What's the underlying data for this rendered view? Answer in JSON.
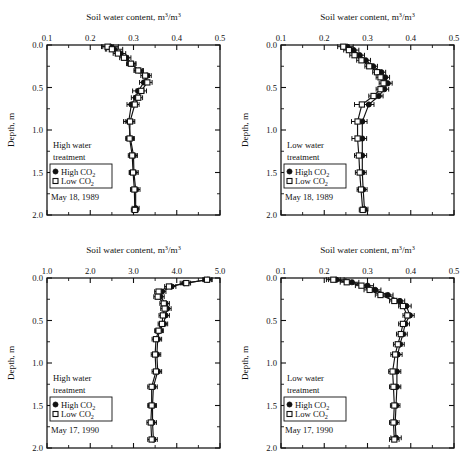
{
  "figure": {
    "background": "#ffffff",
    "ink_color": "#111111",
    "panel_count": 4
  },
  "labels": {
    "xlabel_prefix": "Soil water content, m",
    "xlabel_sup1": "3",
    "xlabel_mid": "/m",
    "xlabel_sup2": "3",
    "ylabel": "Depth, m",
    "legend_high": "High CO",
    "legend_low": "Low CO",
    "legend_sub": "2",
    "treatment_high_line1": "High water",
    "treatment_high_line2": "treatment",
    "treatment_low_line1": "Low water",
    "treatment_low_line2": "treatment",
    "date_1989": "May 18, 1989",
    "date_1990": "May 17, 1990"
  },
  "chart_data": [
    {
      "id": "top-left",
      "type": "line",
      "title": "Soil water content, m3/m3",
      "xlabel": "Soil water content, m3/m3",
      "ylabel": "Depth, m",
      "treatment": "High water treatment",
      "date": "May 18, 1989",
      "xlim": [
        0.1,
        0.5
      ],
      "ylim": [
        0.0,
        2.0
      ],
      "xticks": [
        "0.1",
        "0.2",
        "0.3",
        "0.4",
        "0.5"
      ],
      "xtick_values": [
        0.1,
        0.2,
        0.3,
        0.4,
        0.5
      ],
      "yticks": [
        "0.0",
        "0.5",
        "1.0",
        "1.5",
        "2.0"
      ],
      "ytick_values": [
        0.0,
        0.5,
        1.0,
        1.5,
        2.0
      ],
      "y_inverted": true,
      "grid": false,
      "legend_position": "lower-left",
      "series": [
        {
          "name": "High CO2",
          "marker": "filled-circle",
          "depth": [
            0.02,
            0.05,
            0.1,
            0.15,
            0.22,
            0.3,
            0.36,
            0.44,
            0.54,
            0.62,
            0.7,
            0.9,
            1.1,
            1.3,
            1.5,
            1.7,
            1.92
          ],
          "values": [
            0.247,
            0.255,
            0.27,
            0.284,
            0.296,
            0.313,
            0.331,
            0.324,
            0.311,
            0.305,
            0.295,
            0.289,
            0.293,
            0.3,
            0.301,
            0.305,
            0.305
          ],
          "xerr": [
            0.018,
            0.02,
            0.012,
            0.01,
            0.01,
            0.01,
            0.01,
            0.01,
            0.013,
            0.01,
            0.01,
            0.012,
            0.009,
            0.009,
            0.01,
            0.01,
            0.008
          ]
        },
        {
          "name": "Low CO2",
          "marker": "open-square",
          "depth": [
            0.02,
            0.05,
            0.1,
            0.15,
            0.22,
            0.3,
            0.36,
            0.44,
            0.54,
            0.62,
            0.7,
            0.9,
            1.1,
            1.3,
            1.5,
            1.7,
            1.94
          ],
          "values": [
            0.24,
            0.25,
            0.264,
            0.278,
            0.294,
            0.311,
            0.327,
            0.332,
            0.318,
            0.311,
            0.303,
            0.292,
            0.291,
            0.297,
            0.299,
            0.302,
            0.303
          ],
          "xerr": [
            0.014,
            0.012,
            0.011,
            0.01,
            0.01,
            0.01,
            0.01,
            0.011,
            0.012,
            0.01,
            0.01,
            0.011,
            0.009,
            0.009,
            0.009,
            0.009,
            0.008
          ]
        }
      ]
    },
    {
      "id": "top-right",
      "type": "line",
      "title": "Soil water content, m3/m3",
      "xlabel": "Soil water content, m3/m3",
      "ylabel": "Depth, m",
      "treatment": "Low water treatment",
      "date": "May 18, 1989",
      "xlim": [
        0.1,
        0.5
      ],
      "ylim": [
        0.0,
        2.0
      ],
      "xticks": [
        "0.1",
        "0.2",
        "0.3",
        "0.4",
        "0.5"
      ],
      "xtick_values": [
        0.1,
        0.2,
        0.3,
        0.4,
        0.5
      ],
      "yticks": [
        "0.0",
        "0.5",
        "1.0",
        "1.5",
        "2.0"
      ],
      "ytick_values": [
        0.0,
        0.5,
        1.0,
        1.5,
        2.0
      ],
      "y_inverted": true,
      "grid": false,
      "legend_position": "lower-left",
      "series": [
        {
          "name": "High CO2",
          "marker": "filled-circle",
          "depth": [
            0.02,
            0.06,
            0.12,
            0.18,
            0.25,
            0.32,
            0.38,
            0.45,
            0.52,
            0.6,
            0.7,
            0.9,
            1.1,
            1.3,
            1.5,
            1.7,
            1.93
          ],
          "values": [
            0.253,
            0.268,
            0.282,
            0.296,
            0.313,
            0.332,
            0.341,
            0.347,
            0.339,
            0.326,
            0.303,
            0.288,
            0.288,
            0.288,
            0.288,
            0.29,
            0.293
          ],
          "xerr": [
            0.014,
            0.012,
            0.011,
            0.011,
            0.01,
            0.01,
            0.01,
            0.01,
            0.01,
            0.01,
            0.012,
            0.011,
            0.01,
            0.01,
            0.009,
            0.009,
            0.008
          ]
        },
        {
          "name": "Low CO2",
          "marker": "open-square",
          "depth": [
            0.02,
            0.06,
            0.12,
            0.18,
            0.25,
            0.32,
            0.38,
            0.45,
            0.52,
            0.6,
            0.7,
            0.9,
            1.1,
            1.3,
            1.5,
            1.7,
            1.94
          ],
          "values": [
            0.244,
            0.257,
            0.27,
            0.286,
            0.304,
            0.322,
            0.33,
            0.337,
            0.33,
            0.314,
            0.287,
            0.277,
            0.277,
            0.28,
            0.282,
            0.285,
            0.289
          ],
          "xerr": [
            0.013,
            0.012,
            0.011,
            0.011,
            0.01,
            0.01,
            0.01,
            0.01,
            0.01,
            0.011,
            0.017,
            0.014,
            0.013,
            0.01,
            0.01,
            0.009,
            0.008
          ]
        }
      ]
    },
    {
      "id": "bottom-left",
      "type": "line",
      "title": "Soil water content, m3/m3",
      "xlabel": "Soil water content, m3/m3",
      "ylabel": "Depth, m",
      "treatment": "High water treatment",
      "date": "May 17, 1990",
      "xlim": [
        1.0,
        5.0
      ],
      "ylim": [
        0.0,
        2.0
      ],
      "xticks": [
        "1.0",
        "2.0",
        "3.0",
        "4.0",
        "5.0"
      ],
      "xtick_values": [
        1.0,
        2.0,
        3.0,
        4.0,
        5.0
      ],
      "yticks": [
        "0.0",
        "0.5",
        "1.0",
        "1.5",
        "2.0"
      ],
      "ytick_values": [
        0.0,
        0.5,
        1.0,
        1.5,
        2.0
      ],
      "y_inverted": true,
      "grid": false,
      "legend_position": "lower-left",
      "series": [
        {
          "name": "High CO2",
          "marker": "filled-circle",
          "depth": [
            0.02,
            0.06,
            0.1,
            0.16,
            0.22,
            0.3,
            0.36,
            0.44,
            0.54,
            0.62,
            0.72,
            0.9,
            1.1,
            1.28,
            1.5,
            1.7,
            1.9
          ],
          "values": [
            4.72,
            4.18,
            3.88,
            3.66,
            3.62,
            3.74,
            3.78,
            3.74,
            3.7,
            3.6,
            3.56,
            3.54,
            3.56,
            3.46,
            3.44,
            3.44,
            3.46
          ],
          "xerr": [
            0.1,
            0.1,
            0.1,
            0.09,
            0.09,
            0.09,
            0.09,
            0.09,
            0.09,
            0.09,
            0.09,
            0.09,
            0.09,
            0.09,
            0.09,
            0.09,
            0.09
          ]
        },
        {
          "name": "Low CO2",
          "marker": "open-square",
          "depth": [
            0.02,
            0.06,
            0.1,
            0.16,
            0.22,
            0.3,
            0.36,
            0.44,
            0.54,
            0.62,
            0.72,
            0.9,
            1.1,
            1.28,
            1.5,
            1.7,
            1.9
          ],
          "values": [
            4.7,
            4.22,
            3.82,
            3.58,
            3.56,
            3.7,
            3.72,
            3.68,
            3.66,
            3.58,
            3.52,
            3.5,
            3.52,
            3.42,
            3.42,
            3.4,
            3.42
          ],
          "xerr": [
            0.1,
            0.1,
            0.1,
            0.09,
            0.09,
            0.09,
            0.09,
            0.09,
            0.09,
            0.09,
            0.09,
            0.09,
            0.09,
            0.09,
            0.09,
            0.09,
            0.09
          ]
        }
      ]
    },
    {
      "id": "bottom-right",
      "type": "line",
      "title": "Soil water content, m3/m3",
      "xlabel": "Soil water content, m3/m3",
      "ylabel": "Depth, m",
      "treatment": "Low water treatment",
      "date": "May 17, 1990",
      "xlim": [
        0.1,
        0.5
      ],
      "ylim": [
        0.0,
        2.0
      ],
      "xticks": [
        "0.1",
        "0.2",
        "0.3",
        "0.4",
        "0.5"
      ],
      "xtick_values": [
        0.1,
        0.2,
        0.3,
        0.4,
        0.5
      ],
      "yticks": [
        "0.0",
        "0.5",
        "1.0",
        "1.5",
        "2.0"
      ],
      "ytick_values": [
        0.0,
        0.5,
        1.0,
        1.5,
        2.0
      ],
      "y_inverted": true,
      "grid": false,
      "legend_position": "lower-left",
      "series": [
        {
          "name": "High CO2",
          "marker": "filled-circle",
          "depth": [
            0.02,
            0.05,
            0.09,
            0.14,
            0.2,
            0.27,
            0.33,
            0.44,
            0.54,
            0.66,
            0.78,
            0.9,
            1.1,
            1.28,
            1.5,
            1.7,
            1.88
          ],
          "values": [
            0.228,
            0.264,
            0.3,
            0.318,
            0.347,
            0.375,
            0.39,
            0.398,
            0.387,
            0.382,
            0.375,
            0.37,
            0.368,
            0.368,
            0.366,
            0.364,
            0.366
          ],
          "xerr": [
            0.018,
            0.016,
            0.014,
            0.013,
            0.012,
            0.011,
            0.011,
            0.01,
            0.01,
            0.01,
            0.01,
            0.01,
            0.009,
            0.009,
            0.009,
            0.009,
            0.012
          ]
        },
        {
          "name": "Low CO2",
          "marker": "open-square",
          "depth": [
            0.02,
            0.05,
            0.09,
            0.14,
            0.2,
            0.27,
            0.33,
            0.44,
            0.54,
            0.66,
            0.78,
            0.9,
            1.1,
            1.28,
            1.5,
            1.7,
            1.9
          ],
          "values": [
            0.221,
            0.252,
            0.286,
            0.305,
            0.33,
            0.362,
            0.382,
            0.392,
            0.382,
            0.377,
            0.37,
            0.364,
            0.358,
            0.36,
            0.362,
            0.36,
            0.362
          ],
          "xerr": [
            0.016,
            0.015,
            0.014,
            0.013,
            0.012,
            0.011,
            0.01,
            0.01,
            0.01,
            0.01,
            0.01,
            0.01,
            0.009,
            0.009,
            0.009,
            0.009,
            0.011
          ]
        }
      ]
    }
  ]
}
